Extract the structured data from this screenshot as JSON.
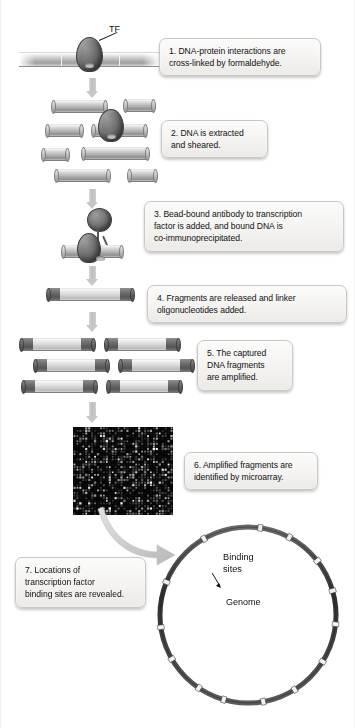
{
  "diagram": {
    "tf_label": "TF",
    "genome_label": "Genome",
    "binding_sites_label": "Binding\nsites",
    "binding_sites_line1": "Binding",
    "binding_sites_line2": "sites",
    "bottom_caption": ""
  },
  "steps": [
    {
      "number": "1",
      "text": "1. DNA-protein interactions are cross-linked by formaldehyde.",
      "line1": "1. DNA-protein interactions are",
      "line2": "cross-linked by formaldehyde."
    },
    {
      "number": "2",
      "text": "2. DNA is extracted and sheared.",
      "line1": "2. DNA is extracted",
      "line2": "and sheared."
    },
    {
      "number": "3",
      "text": "3. Bead-bound antibody to transcription factor is added, and bound DNA is co-immunoprecipitated.",
      "line1": "3. Bead-bound antibody to transcription",
      "line2": "factor is added, and bound DNA is",
      "line3": "co-immunoprecipitated."
    },
    {
      "number": "4",
      "text": "4. Fragments are released and linker oligonucleotides added.",
      "line1": "4. Fragments are released and linker",
      "line2": "oligonucleotides added."
    },
    {
      "number": "5",
      "text": "5. The captured DNA fragments are amplified.",
      "line1": "5. The captured",
      "line2": "DNA fragments",
      "line3": "are amplified."
    },
    {
      "number": "6",
      "text": "6. Amplified fragments are identified by microarray.",
      "line1": "6. Amplified fragments are",
      "line2": "identified by microarray."
    },
    {
      "number": "7",
      "text": "7. Locations of transcription factor binding sites are revealed.",
      "line1": "7. Locations of",
      "line2": "transcription factor",
      "line3": "binding sites are revealed."
    }
  ],
  "colors": {
    "callout_bg": "#f4f3f1",
    "callout_border": "#c9c7c3",
    "arrow_gray": "#c6c6c6",
    "fragment_gray": "#b4b4b4",
    "linker_dark": "#5a5a5a",
    "protein_dark": "#565656",
    "microarray_bg": "#050505",
    "genome_ring": "#3a3a3a",
    "text": "#111111"
  },
  "microarray": {
    "spot_columns": 34,
    "spot_rows": 34,
    "background": "#050505"
  },
  "genome_circle": {
    "binding_site_count": 14,
    "binding_site_angles_deg": [
      8,
      28,
      52,
      74,
      96,
      122,
      148,
      170,
      196,
      214,
      240,
      262,
      292,
      330
    ]
  }
}
